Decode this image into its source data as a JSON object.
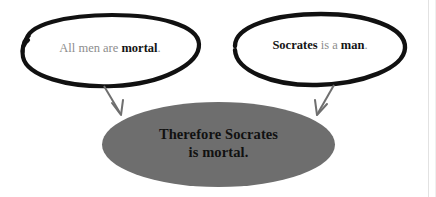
{
  "diagram": {
    "background_color": "#ffffff",
    "premises": [
      {
        "id": "premise-1",
        "shape": "hand-drawn-ellipse",
        "outline_color": "#111111",
        "fill_color": "#ffffff",
        "text_plain": "All men are mortal.",
        "text_normal_1": "All men are ",
        "text_bold_1": "mortal",
        "text_normal_2": "."
      },
      {
        "id": "premise-2",
        "shape": "hand-drawn-ellipse",
        "outline_color": "#111111",
        "fill_color": "#ffffff",
        "text_plain": "Socrates is a man.",
        "text_bold_1": "Socrates",
        "text_normal_1": " is a ",
        "text_bold_2": "man",
        "text_normal_2": "."
      }
    ],
    "conclusion": {
      "id": "conclusion",
      "shape": "ellipse",
      "fill_color": "#6e6e6e",
      "text_color": "#111111",
      "line_1": "Therefore Socrates",
      "line_2": "is mortal.",
      "text_plain": "Therefore Socrates is mortal."
    },
    "arrows": [
      {
        "id": "arrow-left",
        "from": "premise-1",
        "to": "conclusion",
        "direction": "down-right",
        "color": "#6f6f6f"
      },
      {
        "id": "arrow-right",
        "from": "premise-2",
        "to": "conclusion",
        "direction": "down-left",
        "color": "#6f6f6f"
      }
    ]
  }
}
